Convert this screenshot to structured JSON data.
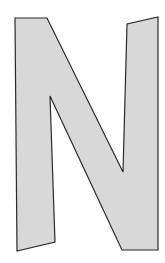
{
  "figure": {
    "letter": "N",
    "fill_color": "#d8d8d8",
    "stroke_color": "#2a2a2a",
    "background_color": "#ffffff"
  }
}
